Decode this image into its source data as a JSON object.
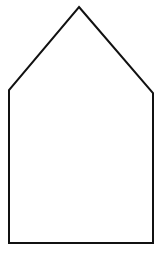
{
  "diagram": {
    "shape": "pentagon-house",
    "background": "#ffffff",
    "stroke_color": "#111111",
    "stroke_width": 2,
    "vertices": [
      {
        "name": "apex",
        "x": 79,
        "y": 7
      },
      {
        "name": "right-shoulder",
        "x": 153,
        "y": 93
      },
      {
        "name": "bottom-right",
        "x": 153,
        "y": 243
      },
      {
        "name": "bottom-left",
        "x": 9,
        "y": 243
      },
      {
        "name": "left-shoulder",
        "x": 9,
        "y": 90
      }
    ]
  }
}
